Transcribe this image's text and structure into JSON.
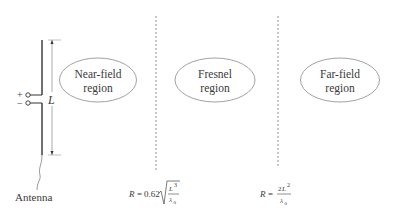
{
  "diagram": {
    "antenna": {
      "label": "Antenna",
      "plus_sign": "+",
      "minus_sign": "−",
      "length_label": "L"
    },
    "regions": [
      {
        "line1": "Near-field",
        "line2": "region"
      },
      {
        "line1": "Fresnel",
        "line2": "region"
      },
      {
        "line1": "Far-field",
        "line2": "region"
      }
    ],
    "boundaries": [
      {
        "formula_lhs": "R",
        "formula_eq": "=",
        "formula_coef": "0.62",
        "numerator": "L",
        "numerator_exp": "3",
        "denominator": "λ",
        "denominator_sub": "0"
      },
      {
        "formula_lhs": "R",
        "formula_eq": "=",
        "numerator_coef": "2",
        "numerator": "L",
        "numerator_exp": "2",
        "denominator": "λ",
        "denominator_sub": "0"
      }
    ],
    "colors": {
      "stroke": "#3a3a3a",
      "dashed": "#777777",
      "ellipse": "#8a8a8a"
    }
  }
}
